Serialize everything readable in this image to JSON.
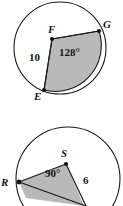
{
  "page": {
    "width": 123,
    "height": 206,
    "background": "#ffffff"
  },
  "style": {
    "stroke_color": "#1a1a1a",
    "shade_fill": "#b7b7b7",
    "shade_fill_light": "#c9c9c9",
    "label_color": "#141414",
    "circle_fill": "#ffffff"
  },
  "figures": [
    {
      "id": "figure-efg",
      "name": "circle-efg",
      "shape": "circle",
      "center": {
        "x": 60,
        "y": 48
      },
      "radius": 46,
      "vertex_label": "F",
      "points": [
        {
          "label": "E",
          "x": 44,
          "y": 90,
          "label_x": 34,
          "label_y": 91,
          "on_circle": true
        },
        {
          "label": "F",
          "x": 52,
          "y": 39,
          "label_x": 48,
          "label_y": 24,
          "on_circle": false
        },
        {
          "label": "G",
          "x": 99,
          "y": 31,
          "label_x": 103,
          "label_y": 19,
          "on_circle": true
        }
      ],
      "measures": [
        {
          "name": "angle",
          "text": "128°",
          "x": 59,
          "y": 47
        },
        {
          "name": "side-length",
          "text": "10",
          "x": 29,
          "y": 52
        }
      ],
      "shaded": true
    },
    {
      "id": "figure-rs",
      "name": "circle-rs",
      "shape": "circle",
      "center": {
        "x": 68,
        "y": 76
      },
      "radius": 52,
      "vertex_label": "S",
      "points": [
        {
          "label": "R",
          "x": 19,
          "y": 79,
          "label_x": 1,
          "label_y": 74,
          "on_circle": true
        },
        {
          "label": "S",
          "x": 66,
          "y": 61,
          "label_x": 61,
          "label_y": 45,
          "on_circle": false
        }
      ],
      "measures": [
        {
          "name": "angle",
          "text": "90°",
          "x": 45,
          "y": 65
        },
        {
          "name": "radius-length",
          "text": "6",
          "x": 83,
          "y": 72
        }
      ],
      "shaded": true
    }
  ]
}
